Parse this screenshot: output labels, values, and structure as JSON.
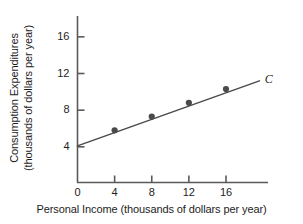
{
  "chart_data": {
    "type": "line",
    "title": "",
    "xlabel": "Personal Income (thousands of dollars per year)",
    "ylabel_line1": "Consumption Expenditures",
    "ylabel_line2": "(thousands of dollars per year)",
    "xlim": [
      0,
      20
    ],
    "ylim": [
      0,
      18
    ],
    "grid": false,
    "legend": "none",
    "xticks": [
      0,
      4,
      8,
      12,
      16
    ],
    "xtick_labels": [
      "0",
      "4",
      "8",
      "12",
      "16"
    ],
    "yticks": [
      4,
      8,
      12,
      16
    ],
    "ytick_labels": [
      "4",
      "8",
      "12",
      "16"
    ],
    "series": [
      {
        "name": "C",
        "label": "C",
        "label_style": "italic",
        "color": "#4a4a4a",
        "marker": "filled-circle",
        "line_x": [
          0,
          19.6
        ],
        "line_y": [
          4.1,
          11.2
        ],
        "x": [
          4,
          8,
          12,
          16
        ],
        "y": [
          5.8,
          7.3,
          8.8,
          10.3
        ]
      }
    ],
    "annotations": [
      {
        "text": "C",
        "x": 20.4,
        "y": 11.4,
        "style": "italic"
      }
    ]
  },
  "axis": {
    "line_color": "#5a5a5a",
    "text_color": "#1d1d1d"
  }
}
